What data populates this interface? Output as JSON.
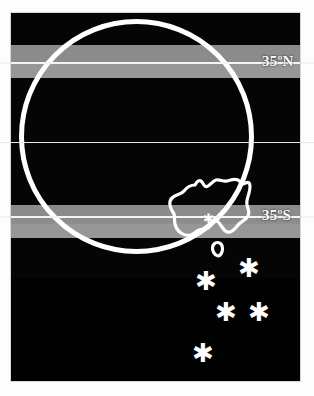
{
  "figure": {
    "background_color": "#ffffff",
    "sky_color": "#050505",
    "band_color": "#8f8f8f",
    "line_color": "#ffffff"
  },
  "latitudes": {
    "north": {
      "label": "35ºN",
      "line_name": "latitude-line-35n",
      "band_name": "latitude-band-35n"
    },
    "equator": {
      "label": "",
      "line_name": "equator-line"
    },
    "south": {
      "label": "35ºS",
      "line_name": "latitude-line-35s",
      "band_name": "latitude-band-35s"
    }
  },
  "globe": {
    "name": "globe-circle",
    "description": "great white circle representing the globe limb"
  },
  "landmass": {
    "name": "australia-outline",
    "label": "Australia",
    "tasmania_label": "Tasmania"
  },
  "stars": {
    "commonwealth": {
      "name": "commonwealth-star",
      "glyph": "✱"
    },
    "constellation": {
      "name": "southern-cross",
      "glyph": "✱",
      "points": [
        {
          "name": "star-gacrux",
          "glyph": "✱"
        },
        {
          "name": "star-becrux",
          "glyph": "✱"
        },
        {
          "name": "star-delta",
          "glyph": "✱"
        },
        {
          "name": "star-epsilon",
          "glyph": "✱"
        },
        {
          "name": "star-acrux",
          "glyph": "✱"
        }
      ]
    }
  }
}
